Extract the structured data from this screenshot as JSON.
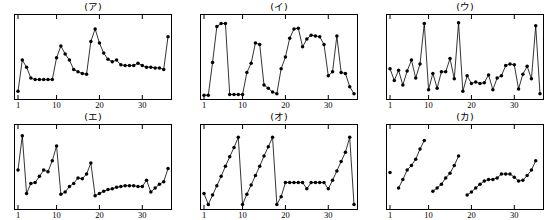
{
  "figure": {
    "layout": {
      "rows": 2,
      "cols": 3
    },
    "style": {
      "line_color": "#000000",
      "marker_color": "#000000",
      "frame_color": "#000000",
      "background": "#ffffff"
    }
  },
  "chart_data": [
    {
      "type": "line",
      "title": "(ア)",
      "xlabel": "",
      "ylabel": "",
      "grid": false,
      "legend": null,
      "xlim": [
        1,
        36
      ],
      "ylim": [
        0,
        10
      ],
      "xticks": [
        1,
        10,
        20,
        30
      ],
      "xtick_labels": [
        "1",
        "10",
        "20",
        "30"
      ],
      "ytick_labels": [],
      "connected": true,
      "x": [
        1,
        2,
        3,
        4,
        5,
        6,
        7,
        8,
        9,
        10,
        11,
        12,
        13,
        14,
        15,
        16,
        17,
        18,
        19,
        20,
        21,
        22,
        23,
        24,
        25,
        26,
        27,
        28,
        29,
        30,
        31,
        32,
        33,
        34,
        35,
        36
      ],
      "values": [
        0.6,
        4.6,
        3.7,
        2.3,
        2.1,
        2.1,
        2.1,
        2.1,
        2.1,
        4.9,
        6.4,
        5.4,
        4.6,
        3.4,
        3.1,
        2.9,
        2.8,
        7.0,
        8.6,
        6.8,
        5.5,
        4.7,
        4.4,
        4.6,
        4.0,
        3.9,
        3.9,
        3.9,
        4.2,
        3.9,
        3.7,
        3.7,
        3.6,
        3.6,
        3.4,
        7.6
      ]
    },
    {
      "type": "line",
      "title": "(イ)",
      "xlabel": "",
      "ylabel": "",
      "grid": false,
      "legend": null,
      "xlim": [
        1,
        36
      ],
      "ylim": [
        0,
        10
      ],
      "xticks": [
        1,
        10,
        20,
        30
      ],
      "xtick_labels": [
        "1",
        "10",
        "20",
        "30"
      ],
      "ytick_labels": [],
      "connected": true,
      "x": [
        1,
        2,
        3,
        4,
        5,
        6,
        7,
        8,
        9,
        10,
        11,
        12,
        13,
        14,
        15,
        16,
        17,
        18,
        19,
        20,
        21,
        22,
        23,
        24,
        25,
        26,
        27,
        28,
        29,
        30,
        31,
        32,
        33,
        34,
        35,
        36
      ],
      "values": [
        0.1,
        0.1,
        4.3,
        8.9,
        9.3,
        9.3,
        0.2,
        0.2,
        0.2,
        0.2,
        3.0,
        4.2,
        6.8,
        6.6,
        1.4,
        1.0,
        0.5,
        0.3,
        3.5,
        5.0,
        7.4,
        8.6,
        8.7,
        6.3,
        7.3,
        7.8,
        7.7,
        7.6,
        6.6,
        2.6,
        3.1,
        7.7,
        3.0,
        2.9,
        1.2,
        0.3
      ]
    },
    {
      "type": "line",
      "title": "(ウ)",
      "xlabel": "",
      "ylabel": "",
      "grid": false,
      "legend": null,
      "xlim": [
        1,
        36
      ],
      "ylim": [
        0,
        10
      ],
      "xticks": [
        1,
        10,
        20,
        30
      ],
      "xtick_labels": [
        "1",
        "10",
        "20",
        "30"
      ],
      "ytick_labels": [],
      "connected": true,
      "x": [
        1,
        2,
        3,
        4,
        5,
        6,
        7,
        8,
        9,
        10,
        11,
        12,
        13,
        14,
        15,
        16,
        17,
        18,
        19,
        20,
        21,
        22,
        23,
        24,
        25,
        26,
        27,
        28,
        29,
        30,
        31,
        32,
        33,
        34,
        35,
        36
      ],
      "values": [
        3.5,
        2.0,
        3.3,
        1.4,
        3.2,
        4.6,
        2.3,
        4.1,
        9.3,
        0.8,
        2.9,
        1.0,
        3.1,
        3.1,
        4.8,
        2.2,
        9.4,
        0.6,
        2.6,
        1.6,
        1.8,
        1.6,
        1.7,
        2.7,
        0.8,
        2.3,
        2.6,
        3.9,
        4.1,
        4.0,
        0.9,
        2.8,
        3.8,
        2.2,
        9.0,
        0.3
      ]
    },
    {
      "type": "line",
      "title": "(エ)",
      "xlabel": "",
      "ylabel": "",
      "grid": false,
      "legend": null,
      "xlim": [
        1,
        36
      ],
      "ylim": [
        0,
        10
      ],
      "xticks": [
        1,
        10,
        20,
        30
      ],
      "xtick_labels": [
        "1",
        "10",
        "20",
        "30"
      ],
      "ytick_labels": [],
      "connected": true,
      "x": [
        1,
        2,
        3,
        4,
        5,
        6,
        7,
        8,
        9,
        10,
        11,
        12,
        13,
        14,
        15,
        16,
        17,
        18,
        19,
        20,
        21,
        22,
        23,
        24,
        25,
        26,
        27,
        28,
        29,
        30,
        31,
        32,
        33,
        34,
        35,
        36
      ],
      "values": [
        4.6,
        9.0,
        1.6,
        2.9,
        3.0,
        3.8,
        4.6,
        4.4,
        5.8,
        7.7,
        1.5,
        1.8,
        2.5,
        2.9,
        3.6,
        3.5,
        4.1,
        5.5,
        1.3,
        1.6,
        1.9,
        2.1,
        2.2,
        2.4,
        2.5,
        2.6,
        2.6,
        2.6,
        2.5,
        2.5,
        3.3,
        1.8,
        2.3,
        2.8,
        3.1,
        4.8
      ]
    },
    {
      "type": "line",
      "title": "(オ)",
      "xlabel": "",
      "ylabel": "",
      "grid": false,
      "legend": null,
      "xlim": [
        1,
        36
      ],
      "ylim": [
        0,
        10
      ],
      "xticks": [
        1,
        10,
        20,
        30
      ],
      "xtick_labels": [
        "1",
        "10",
        "20",
        "30"
      ],
      "ytick_labels": [],
      "connected": true,
      "x": [
        1,
        2,
        3,
        4,
        5,
        6,
        7,
        8,
        9,
        10,
        11,
        12,
        13,
        14,
        15,
        16,
        17,
        18,
        19,
        20,
        21,
        22,
        23,
        24,
        25,
        26,
        27,
        28,
        29,
        30,
        31,
        32,
        33,
        34,
        35,
        36
      ],
      "values": [
        1.6,
        0.2,
        1.4,
        2.6,
        3.8,
        5.1,
        6.3,
        7.5,
        8.8,
        0.2,
        1.5,
        2.7,
        3.9,
        5.1,
        6.4,
        7.6,
        8.8,
        0.2,
        1.2,
        3.0,
        3.0,
        3.0,
        3.0,
        3.0,
        2.2,
        3.0,
        3.0,
        3.0,
        3.0,
        2.2,
        3.3,
        4.5,
        5.7,
        6.9,
        8.8,
        0.2
      ]
    },
    {
      "type": "line",
      "title": "(カ)",
      "xlabel": "",
      "ylabel": "",
      "grid": false,
      "legend": null,
      "xlim": [
        1,
        36
      ],
      "ylim": [
        0,
        10
      ],
      "xticks": [
        1,
        10,
        20,
        30
      ],
      "xtick_labels": [
        "1",
        "10",
        "20",
        "30"
      ],
      "ytick_labels": [],
      "connected": false,
      "segments": [
        {
          "x": [
            1
          ],
          "values": [
            4.3
          ]
        },
        {
          "x": [
            3,
            4,
            5,
            6,
            7,
            8,
            9
          ],
          "values": [
            2.3,
            3.4,
            4.6,
            5.2,
            6.0,
            7.3,
            8.4
          ]
        },
        {
          "x": [
            11,
            12,
            13,
            14,
            15,
            16,
            17
          ],
          "values": [
            1.9,
            2.3,
            2.8,
            3.6,
            4.2,
            5.2,
            6.4
          ]
        },
        {
          "x": [
            19,
            20,
            21,
            22,
            23,
            24,
            25,
            26,
            27,
            28,
            29,
            30,
            31,
            32,
            33,
            34,
            35
          ],
          "values": [
            1.4,
            1.8,
            2.3,
            2.8,
            3.2,
            3.4,
            3.4,
            3.6,
            4.1,
            4.1,
            4.1,
            3.7,
            3.2,
            3.3,
            3.9,
            4.6,
            5.8
          ]
        }
      ],
      "x": [
        1,
        3,
        4,
        5,
        6,
        7,
        8,
        9,
        11,
        12,
        13,
        14,
        15,
        16,
        17,
        19,
        20,
        21,
        22,
        23,
        24,
        25,
        26,
        27,
        28,
        29,
        30,
        31,
        32,
        33,
        34,
        35
      ],
      "values": [
        4.3,
        2.3,
        3.4,
        4.6,
        5.2,
        6.0,
        7.3,
        8.4,
        1.9,
        2.3,
        2.8,
        3.6,
        4.2,
        5.2,
        6.4,
        1.4,
        1.8,
        2.3,
        2.8,
        3.2,
        3.4,
        3.4,
        3.6,
        4.1,
        4.1,
        4.1,
        3.7,
        3.2,
        3.3,
        3.9,
        4.6,
        5.8
      ]
    }
  ]
}
